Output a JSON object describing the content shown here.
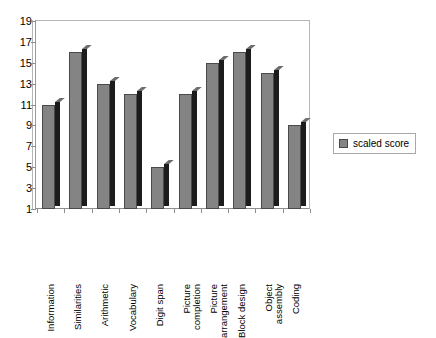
{
  "chart_data": {
    "type": "bar",
    "title": "",
    "subtitle": "",
    "xlabel": "",
    "ylabel": "",
    "ylim": [
      1,
      19
    ],
    "y_ticks": [
      19,
      17,
      15,
      13,
      11,
      9,
      7,
      5,
      3,
      1
    ],
    "grid": false,
    "legend_position": "right",
    "categories": [
      "Information",
      "Similarities",
      "Arithmetic",
      "Vocabulary",
      "Digit span",
      "Picture completion",
      "Picture arrangement",
      "Block design",
      "Object assembly",
      "Coding"
    ],
    "category_lines": [
      [
        "Information"
      ],
      [
        "Similarities"
      ],
      [
        "Arithmetic"
      ],
      [
        "Vocabulary"
      ],
      [
        "Digit span"
      ],
      [
        "Picture",
        "completion"
      ],
      [
        "Picture",
        "arrangement"
      ],
      [
        "Block design"
      ],
      [
        "Object",
        "assembly"
      ],
      [
        "Coding"
      ]
    ],
    "series": [
      {
        "name": "scaled score",
        "values": [
          11,
          16,
          13,
          12,
          5,
          12,
          15,
          16,
          14,
          9
        ]
      }
    ]
  },
  "legend": {
    "entries": [
      {
        "label": "scaled score",
        "color": "#848484"
      }
    ]
  },
  "colors": {
    "bar_face": "#848484",
    "bar_side": "#1c1c1c",
    "bar_outline": "#4a4a4a",
    "axis": "#8e8e8e",
    "frame": "#b6b6b6",
    "plot_background": "#ffffff",
    "page_background": "#ffffff",
    "text": "#000000"
  }
}
